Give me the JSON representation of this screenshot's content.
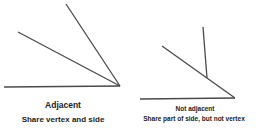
{
  "line_color": "#4a4a4a",
  "panels": [
    {
      "title": "Adjacent",
      "subtitle": "Share vertex and side",
      "lines": [
        {
          "x1": 4,
          "y1": 87,
          "x2": 120,
          "y2": 86
        },
        {
          "x1": 18,
          "y1": 32,
          "x2": 120,
          "y2": 86
        },
        {
          "x1": 66,
          "y1": 4,
          "x2": 120,
          "y2": 86
        }
      ]
    },
    {
      "title": "Not adjacent",
      "subtitle": "Share part of side, but not vertex",
      "lines": [
        {
          "x1": 140,
          "y1": 99,
          "x2": 235,
          "y2": 98
        },
        {
          "x1": 162,
          "y1": 46,
          "x2": 235,
          "y2": 98
        },
        {
          "x1": 203,
          "y1": 27,
          "x2": 207,
          "y2": 78
        }
      ]
    }
  ]
}
